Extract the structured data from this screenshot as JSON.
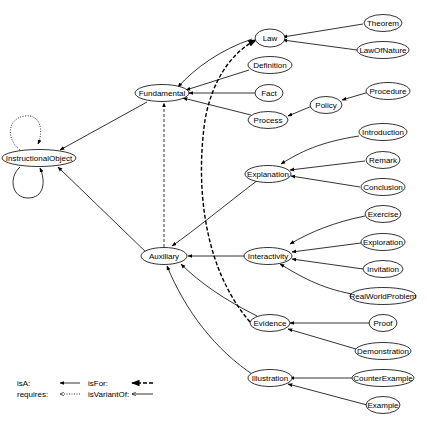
{
  "diagram": {
    "nodes": {
      "instructional_object": "InstructionalObject",
      "fundamental": "Fundamental",
      "auxiliary": "Auxiliary",
      "law": "Law",
      "definition": "Definition",
      "fact": "Fact",
      "process": "Process",
      "policy": "Policy",
      "procedure": "Procedure",
      "theorem": "Theorem",
      "law_of_nature": "LawOfNature",
      "explanation": "Explanation",
      "introduction": "Introduction",
      "remark": "Remark",
      "conclusion": "Conclusion",
      "interactivity": "Interactivity",
      "exercise": "Exercise",
      "exploration": "Exploration",
      "invitation": "Invitation",
      "real_world_problem": "RealWorldProblem",
      "evidence": "Evidence",
      "proof": "Proof",
      "demonstration": "Demonstration",
      "illustration": "Illustration",
      "counter_example": "CounterExample",
      "example": "Example"
    },
    "edges": [
      {
        "from": "Fundamental",
        "to": "InstructionalObject",
        "type": "isA"
      },
      {
        "from": "Auxiliary",
        "to": "InstructionalObject",
        "type": "isA"
      },
      {
        "from": "InstructionalObject",
        "to": "InstructionalObject",
        "type": "isA"
      },
      {
        "from": "InstructionalObject",
        "to": "InstructionalObject",
        "type": "requires"
      },
      {
        "from": "Law",
        "to": "Fundamental",
        "type": "isA"
      },
      {
        "from": "Definition",
        "to": "Fundamental",
        "type": "isA"
      },
      {
        "from": "Fact",
        "to": "Fundamental",
        "type": "isA"
      },
      {
        "from": "Process",
        "to": "Fundamental",
        "type": "isA"
      },
      {
        "from": "Policy",
        "to": "Process",
        "type": "isA"
      },
      {
        "from": "Procedure",
        "to": "Policy",
        "type": "isA"
      },
      {
        "from": "Theorem",
        "to": "Law",
        "type": "isA"
      },
      {
        "from": "LawOfNature",
        "to": "Law",
        "type": "isA"
      },
      {
        "from": "Explanation",
        "to": "Auxiliary",
        "type": "isA"
      },
      {
        "from": "Introduction",
        "to": "Explanation",
        "type": "isA"
      },
      {
        "from": "Remark",
        "to": "Explanation",
        "type": "isA"
      },
      {
        "from": "Conclusion",
        "to": "Explanation",
        "type": "isA"
      },
      {
        "from": "Interactivity",
        "to": "Auxiliary",
        "type": "isA"
      },
      {
        "from": "Exercise",
        "to": "Interactivity",
        "type": "isA"
      },
      {
        "from": "Exploration",
        "to": "Interactivity",
        "type": "isA"
      },
      {
        "from": "Invitation",
        "to": "Interactivity",
        "type": "isA"
      },
      {
        "from": "RealWorldProblem",
        "to": "Interactivity",
        "type": "isA"
      },
      {
        "from": "Evidence",
        "to": "Auxiliary",
        "type": "isA"
      },
      {
        "from": "Proof",
        "to": "Evidence",
        "type": "isA"
      },
      {
        "from": "Demonstration",
        "to": "Evidence",
        "type": "isA"
      },
      {
        "from": "Illustration",
        "to": "Auxiliary",
        "type": "isA"
      },
      {
        "from": "CounterExample",
        "to": "Illustration",
        "type": "isA"
      },
      {
        "from": "Example",
        "to": "Illustration",
        "type": "isA"
      },
      {
        "from": "Auxiliary",
        "to": "Fundamental",
        "type": "isFor"
      },
      {
        "from": "Evidence",
        "to": "Law",
        "type": "isFor"
      }
    ]
  },
  "legend": {
    "isA": "isA:",
    "requires": "requires:",
    "isFor": "isFor:",
    "isVariantOf": "isVariantOf:"
  }
}
